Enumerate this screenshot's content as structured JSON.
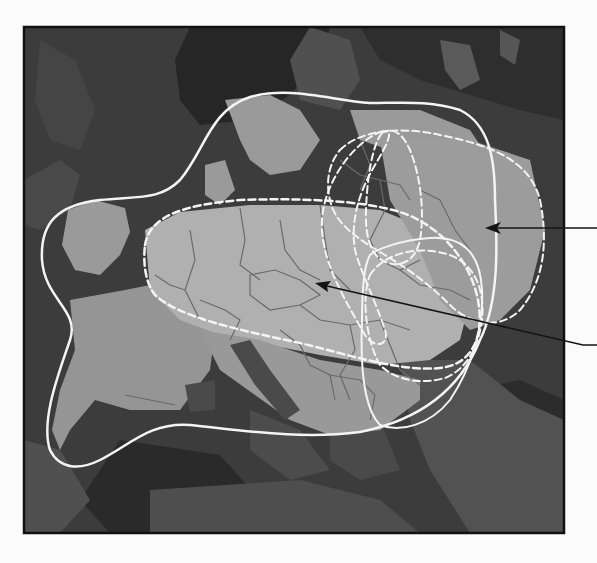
{
  "figure": {
    "description": "Grayscale map of Europe with overlaid region boundaries and two callout arrows",
    "frame": {
      "x": 24,
      "y": 27,
      "width": 540,
      "height": 506
    }
  },
  "colors": {
    "page_background": "#fbfbfb",
    "frame_border": "#111111",
    "sea": "#3c3c3c",
    "sea_dark": "#262626",
    "land_outside": "#555555",
    "land_inside": "#9a9a9a",
    "land_highlight": "#b4b4b4",
    "country_border": "#6a6a6a",
    "solid_outline": "#f4f4f4",
    "dashed_outline": "#f4f4f4",
    "arrow": "#141414"
  },
  "outlines": {
    "solid_main": {
      "style": "solid",
      "label": "outer region (solid white)"
    },
    "solid_east": {
      "style": "solid",
      "label": "eastern region (solid white)"
    },
    "dashed_central": {
      "style": "dashed",
      "label": "central region (dashed white)"
    },
    "dashed_east_large": {
      "style": "dashed",
      "label": "eastern region large (dashed white)"
    },
    "dashed_east_inner": {
      "style": "dashed",
      "label": "eastern region inner (dashed white)"
    },
    "dashed_east_tall": {
      "style": "dashed",
      "label": "eastern region tall (dashed white)"
    },
    "dashed_south": {
      "style": "dashed",
      "label": "southeastern region (dashed white)"
    }
  },
  "callouts": [
    {
      "id": "arrow-upper",
      "tip": [
        485,
        228
      ],
      "tail": [
        597,
        228
      ],
      "label": ""
    },
    {
      "id": "arrow-lower",
      "tip": [
        315,
        283
      ],
      "tail": [
        597,
        345
      ],
      "label": ""
    }
  ]
}
